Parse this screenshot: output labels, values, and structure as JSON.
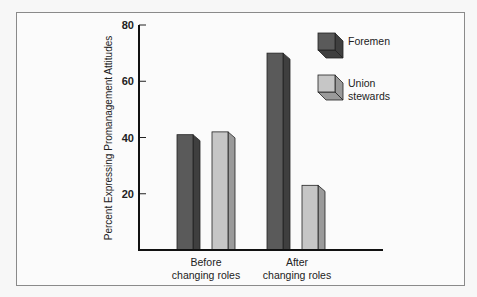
{
  "chart_data": {
    "type": "bar",
    "title": "",
    "xlabel": "",
    "ylabel": "Percent Expressing Promanagement Attitudes",
    "categories": [
      "Before changing roles",
      "After changing roles"
    ],
    "category_lines": [
      [
        "Before",
        "changing roles"
      ],
      [
        "After",
        "changing roles"
      ]
    ],
    "series": [
      {
        "name": "Foremen",
        "values": [
          41,
          70
        ],
        "color": "#5a5a5a",
        "side_color": "#3f3f3f"
      },
      {
        "name": "Union stewards",
        "values": [
          42,
          23
        ],
        "color": "#c6c6c6",
        "side_color": "#9a9a9a"
      }
    ],
    "legend": [
      {
        "lines": [
          "Foremen"
        ]
      },
      {
        "lines": [
          "Union",
          "stewards"
        ]
      }
    ],
    "yticks": [
      20,
      40,
      60,
      80
    ],
    "ylim": [
      0,
      80
    ],
    "grid": false,
    "legend_position": "top-right"
  }
}
